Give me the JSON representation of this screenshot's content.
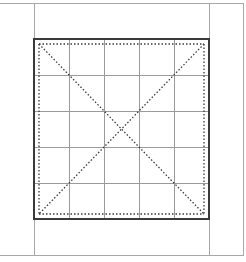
{
  "diagram": {
    "type": "practice-grid",
    "frame": {
      "top": 3,
      "bottom": 255,
      "right": 243,
      "column_left": 34,
      "column_right": 209,
      "color": "#a8a8a8"
    },
    "square": {
      "x": 34,
      "y": 39,
      "width": 175,
      "height": 180,
      "border_color": "#3a3a3a",
      "border_width": 2
    },
    "grid": {
      "rows": 5,
      "cols": 5,
      "line_color": "#9a9a9a"
    },
    "guides": {
      "inset": 5,
      "style": "dotted",
      "color": "#3a3a3a",
      "diagonals": true
    }
  }
}
